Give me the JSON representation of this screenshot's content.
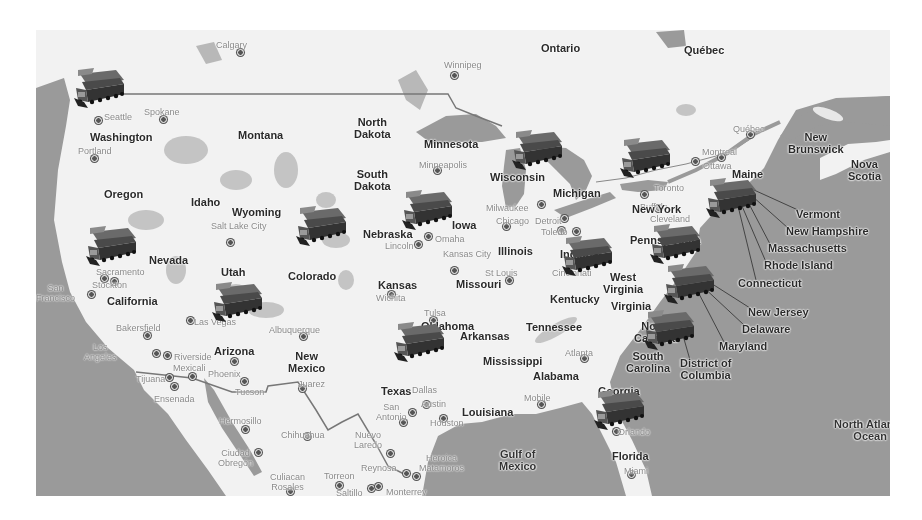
{
  "map": {
    "type": "road-map",
    "style": "grayscale",
    "region": "United States",
    "marker_icon": "truck-icon",
    "colors": {
      "land": "#f2f2f2",
      "water": "#9a9a9a",
      "parks": "#bdbdbd",
      "labels": "#2a2a2a",
      "city_labels": "#8a8a8a"
    }
  },
  "regions": [
    {
      "name": "Ontario",
      "x": 505,
      "y": 12
    },
    {
      "name": "Québec",
      "x": 648,
      "y": 14
    },
    {
      "name": "Washington",
      "x": 54,
      "y": 101
    },
    {
      "name": "Montana",
      "x": 202,
      "y": 99
    },
    {
      "name": "North Dakota",
      "x": 318,
      "y": 86,
      "center": true
    },
    {
      "name": "Minnesota",
      "x": 388,
      "y": 108
    },
    {
      "name": "Oregon",
      "x": 68,
      "y": 158
    },
    {
      "name": "Idaho",
      "x": 155,
      "y": 166
    },
    {
      "name": "South Dakota",
      "x": 318,
      "y": 138,
      "center": true
    },
    {
      "name": "Wyoming",
      "x": 196,
      "y": 176
    },
    {
      "name": "Wisconsin",
      "x": 454,
      "y": 141
    },
    {
      "name": "Michigan",
      "x": 517,
      "y": 157
    },
    {
      "name": "Iowa",
      "x": 416,
      "y": 189
    },
    {
      "name": "Nebraska",
      "x": 327,
      "y": 198
    },
    {
      "name": "Nevada",
      "x": 113,
      "y": 224
    },
    {
      "name": "Utah",
      "x": 185,
      "y": 236
    },
    {
      "name": "Colorado",
      "x": 252,
      "y": 240
    },
    {
      "name": "California",
      "x": 71,
      "y": 265
    },
    {
      "name": "Illinois",
      "x": 462,
      "y": 215
    },
    {
      "name": "Indiana",
      "x": 524,
      "y": 218
    },
    {
      "name": "Kansas",
      "x": 342,
      "y": 249
    },
    {
      "name": "Missouri",
      "x": 420,
      "y": 248
    },
    {
      "name": "Kentucky",
      "x": 514,
      "y": 263
    },
    {
      "name": "West Virginia",
      "x": 567,
      "y": 241,
      "center": true
    },
    {
      "name": "Virginia",
      "x": 575,
      "y": 270
    },
    {
      "name": "New York",
      "x": 596,
      "y": 173
    },
    {
      "name": "Pennsylvania",
      "x": 594,
      "y": 204
    },
    {
      "name": "Maine",
      "x": 696,
      "y": 138
    },
    {
      "name": "New Brunswick",
      "x": 752,
      "y": 101,
      "center": true
    },
    {
      "name": "Nova Scotia",
      "x": 812,
      "y": 128,
      "center": true
    },
    {
      "name": "Arizona",
      "x": 178,
      "y": 315
    },
    {
      "name": "New Mexico",
      "x": 252,
      "y": 320,
      "center": true
    },
    {
      "name": "Oklahoma",
      "x": 385,
      "y": 290
    },
    {
      "name": "Arkansas",
      "x": 424,
      "y": 300
    },
    {
      "name": "Tennessee",
      "x": 490,
      "y": 291
    },
    {
      "name": "North Carolina",
      "x": 598,
      "y": 290,
      "center": true
    },
    {
      "name": "South Carolina",
      "x": 590,
      "y": 320,
      "center": true
    },
    {
      "name": "Mississippi",
      "x": 447,
      "y": 325
    },
    {
      "name": "Alabama",
      "x": 497,
      "y": 340
    },
    {
      "name": "Georgia",
      "x": 562,
      "y": 355
    },
    {
      "name": "Texas",
      "x": 345,
      "y": 355
    },
    {
      "name": "Louisiana",
      "x": 426,
      "y": 376
    },
    {
      "name": "Florida",
      "x": 576,
      "y": 420
    },
    {
      "name": "Gulf of Mexico",
      "x": 463,
      "y": 418,
      "center": true
    },
    {
      "name": "North Atlantic Ocean",
      "x": 798,
      "y": 388,
      "center": true
    }
  ],
  "callouts": [
    {
      "name": "Vermont",
      "x": 760,
      "y": 178
    },
    {
      "name": "New Hampshire",
      "x": 750,
      "y": 195
    },
    {
      "name": "Massachusetts",
      "x": 732,
      "y": 212
    },
    {
      "name": "Rhode Island",
      "x": 728,
      "y": 229
    },
    {
      "name": "Connecticut",
      "x": 702,
      "y": 247
    },
    {
      "name": "New Jersey",
      "x": 712,
      "y": 276
    },
    {
      "name": "Delaware",
      "x": 706,
      "y": 293
    },
    {
      "name": "Maryland",
      "x": 683,
      "y": 310
    },
    {
      "name": "District of Columbia",
      "x": 644,
      "y": 327,
      "center": true
    }
  ],
  "cities": [
    {
      "name": "Calgary",
      "x": 180,
      "y": 10,
      "dx": 204,
      "dy": 22
    },
    {
      "name": "Winnipeg",
      "x": 408,
      "y": 30,
      "dx": 418,
      "dy": 45
    },
    {
      "name": "Spokane",
      "x": 108,
      "y": 77,
      "dx": 127,
      "dy": 89
    },
    {
      "name": "Seattle",
      "x": 68,
      "y": 82,
      "dx": 62,
      "dy": 90
    },
    {
      "name": "Portland",
      "x": 42,
      "y": 116,
      "dx": 58,
      "dy": 128
    },
    {
      "name": "Québec",
      "x": 697,
      "y": 94,
      "dx": 714,
      "dy": 104
    },
    {
      "name": "Montreal",
      "x": 666,
      "y": 117,
      "dx": 685,
      "dy": 127
    },
    {
      "name": "Ottawa",
      "x": 667,
      "y": 131,
      "dx": 659,
      "dy": 131
    },
    {
      "name": "Minneapolis",
      "x": 383,
      "y": 130,
      "dx": 401,
      "dy": 140
    },
    {
      "name": "Milwaukee",
      "x": 450,
      "y": 173,
      "dx": 505,
      "dy": 174
    },
    {
      "name": "Chicago",
      "x": 460,
      "y": 186,
      "dx": 470,
      "dy": 196
    },
    {
      "name": "Detroit",
      "x": 499,
      "y": 186,
      "dx": 528,
      "dy": 188
    },
    {
      "name": "Toledo",
      "x": 505,
      "y": 197,
      "dx": 525,
      "dy": 200
    },
    {
      "name": "Toronto",
      "x": 618,
      "y": 153,
      "dx": 608,
      "dy": 164
    },
    {
      "name": "Buffalo",
      "x": 604,
      "y": 172,
      "dx": 622,
      "dy": 178
    },
    {
      "name": "Cleveland",
      "x": 614,
      "y": 184,
      "dx": 540,
      "dy": 201
    },
    {
      "name": "Salt Lake City",
      "x": 175,
      "y": 191,
      "dx": 194,
      "dy": 212
    },
    {
      "name": "Omaha",
      "x": 399,
      "y": 204,
      "dx": 392,
      "dy": 206
    },
    {
      "name": "Lincoln",
      "x": 349,
      "y": 211,
      "dx": 382,
      "dy": 214
    },
    {
      "name": "Kansas City",
      "x": 407,
      "y": 219,
      "dx": 418,
      "dy": 240
    },
    {
      "name": "St Louis",
      "x": 449,
      "y": 238,
      "dx": 473,
      "dy": 250
    },
    {
      "name": "Cincinnati",
      "x": 516,
      "y": 238,
      "dx": 561,
      "dy": 221
    },
    {
      "name": "Sacramento",
      "x": 60,
      "y": 237,
      "dx": 68,
      "dy": 248
    },
    {
      "name": "Stockton",
      "x": 56,
      "y": 250,
      "dx": 78,
      "dy": 251
    },
    {
      "name": "San Francisco",
      "x": 0,
      "y": 253,
      "center": true,
      "dx": 55,
      "dy": 264
    },
    {
      "name": "Wichita",
      "x": 340,
      "y": 263,
      "dx": 355,
      "dy": 264
    },
    {
      "name": "Tulsa",
      "x": 388,
      "y": 278,
      "dx": 397,
      "dy": 290
    },
    {
      "name": "Bakersfield",
      "x": 80,
      "y": 293,
      "dx": 111,
      "dy": 305
    },
    {
      "name": "Las Vegas",
      "x": 158,
      "y": 287,
      "dx": 154,
      "dy": 290
    },
    {
      "name": "Albuquerque",
      "x": 233,
      "y": 295,
      "dx": 267,
      "dy": 306
    },
    {
      "name": "Dallas",
      "x": 376,
      "y": 355,
      "dx": 390,
      "dy": 374
    },
    {
      "name": "Atlanta",
      "x": 529,
      "y": 318,
      "dx": 548,
      "dy": 328
    },
    {
      "name": "Los Angeles",
      "x": 48,
      "y": 312,
      "center": true,
      "dx": 120,
      "dy": 323
    },
    {
      "name": "Riverside",
      "x": 138,
      "y": 322,
      "dx": 131,
      "dy": 325
    },
    {
      "name": "Phoenix",
      "x": 172,
      "y": 339,
      "dx": 198,
      "dy": 331
    },
    {
      "name": "Mexicali",
      "x": 137,
      "y": 333,
      "dx": 156,
      "dy": 346
    },
    {
      "name": "Tijuana",
      "x": 100,
      "y": 344,
      "dx": 133,
      "dy": 347
    },
    {
      "name": "Tucson",
      "x": 199,
      "y": 357,
      "dx": 208,
      "dy": 351
    },
    {
      "name": "Juarez",
      "x": 262,
      "y": 349,
      "dx": 266,
      "dy": 358
    },
    {
      "name": "Ensenada",
      "x": 118,
      "y": 364,
      "dx": 138,
      "dy": 356
    },
    {
      "name": "Austin",
      "x": 385,
      "y": 369,
      "dx": 376,
      "dy": 382
    },
    {
      "name": "San Antonio",
      "x": 340,
      "y": 372,
      "center": true,
      "dx": 367,
      "dy": 392
    },
    {
      "name": "Houston",
      "x": 394,
      "y": 388,
      "dx": 407,
      "dy": 388
    },
    {
      "name": "Mobile",
      "x": 488,
      "y": 363,
      "dx": 505,
      "dy": 374
    },
    {
      "name": "Hermosillo",
      "x": 183,
      "y": 386,
      "dx": 209,
      "dy": 399
    },
    {
      "name": "Chihuahua",
      "x": 245,
      "y": 400,
      "dx": 271,
      "dy": 406
    },
    {
      "name": "Nuevo Laredo",
      "x": 318,
      "y": 400,
      "center": true,
      "dx": 354,
      "dy": 423
    },
    {
      "name": "Ciudad Obregón",
      "x": 182,
      "y": 418,
      "center": true,
      "dx": 222,
      "dy": 422
    },
    {
      "name": "Heroica Matamoros",
      "x": 383,
      "y": 423,
      "center": true,
      "dx": 380,
      "dy": 446
    },
    {
      "name": "Reynosa",
      "x": 325,
      "y": 433,
      "dx": 370,
      "dy": 443
    },
    {
      "name": "Culiacan Rosales",
      "x": 234,
      "y": 442,
      "center": true,
      "dx": 254,
      "dy": 461
    },
    {
      "name": "Torreon",
      "x": 288,
      "y": 441,
      "dx": 303,
      "dy": 455
    },
    {
      "name": "Saltillo",
      "x": 300,
      "y": 458,
      "dx": 335,
      "dy": 458
    },
    {
      "name": "Monterrey",
      "x": 350,
      "y": 457,
      "dx": 342,
      "dy": 456
    },
    {
      "name": "Orlando",
      "x": 582,
      "y": 397,
      "dx": 580,
      "dy": 401
    },
    {
      "name": "Miami",
      "x": 588,
      "y": 436,
      "dx": 595,
      "dy": 444
    }
  ],
  "trucks": [
    {
      "id": "seattle",
      "x": 36,
      "y": 38
    },
    {
      "id": "sacramento",
      "x": 48,
      "y": 196
    },
    {
      "id": "utah",
      "x": 174,
      "y": 252
    },
    {
      "id": "wyoming",
      "x": 258,
      "y": 176
    },
    {
      "id": "nebraska",
      "x": 364,
      "y": 160
    },
    {
      "id": "wisconsin",
      "x": 474,
      "y": 100
    },
    {
      "id": "ontario",
      "x": 582,
      "y": 108
    },
    {
      "id": "new-york",
      "x": 668,
      "y": 148
    },
    {
      "id": "indiana",
      "x": 524,
      "y": 206
    },
    {
      "id": "pennsylvania",
      "x": 612,
      "y": 194
    },
    {
      "id": "virginia",
      "x": 626,
      "y": 234
    },
    {
      "id": "north-carolina",
      "x": 606,
      "y": 280
    },
    {
      "id": "oklahoma",
      "x": 356,
      "y": 292
    },
    {
      "id": "georgia",
      "x": 556,
      "y": 360
    }
  ]
}
